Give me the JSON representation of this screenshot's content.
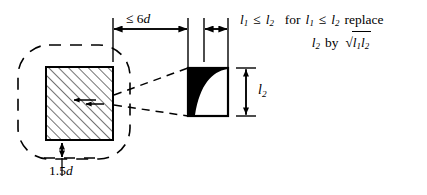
{
  "figure": {
    "background_color": "#ffffff",
    "line_color": "#000000",
    "fill_color": "#000000",
    "hatch_color": "#000000"
  },
  "dimensions": {
    "horizontal_span": {
      "label_text": "≤ 6",
      "label_symbol": "d",
      "label_full": "≤ 6d",
      "name": "six-d-dimension"
    },
    "short_span": {
      "label_full": "",
      "name": "short-dimension"
    },
    "vertical_offset": {
      "label_text": "1.5",
      "label_symbol": "d",
      "label_full": "1.5d",
      "name": "one-point-five-d-dimension"
    },
    "detail_height": {
      "label_base": "l",
      "label_sub": "2",
      "label_full": "l2",
      "name": "l2-dimension"
    }
  },
  "notes": {
    "line1": {
      "cond_base_a": "l",
      "cond_sub_a": "1",
      "rel": "≤",
      "cond_base_b": "l",
      "cond_sub_b": "2",
      "for_word": "for",
      "replace_word": "replace"
    },
    "line2": {
      "target_base": "l",
      "target_sub": "2",
      "by_word": "by",
      "radical": "√",
      "rad_base_a": "l",
      "rad_sub_a": "1",
      "rad_base_b": "l",
      "rad_sub_b": "2"
    },
    "plain_text_line1": "l1 ≤ l2   for l1 ≤ l2 replace",
    "plain_text_line2": "l2 by √(l1 l2)"
  },
  "shapes": {
    "column_section": {
      "name": "hatched-column-section",
      "hatch_pattern": "45-degree diagonal lines",
      "x": 46,
      "y": 67,
      "width": 67,
      "height": 73
    },
    "control_perimeter": {
      "name": "dashed-control-perimeter",
      "style": "dashed rounded rectangle",
      "x": 18,
      "y": 45,
      "width": 112,
      "height": 114,
      "corner_radius": 30
    },
    "detail_view": {
      "name": "shear-distribution-detail",
      "style": "square with black concave filled region at upper-left",
      "x": 188,
      "y": 68,
      "width": 40,
      "height": 48
    },
    "projection_lines": {
      "name": "detail-projection-lines",
      "style": "dashed"
    }
  }
}
